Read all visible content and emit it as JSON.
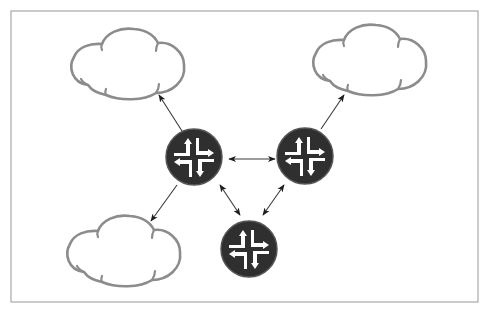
{
  "diagram": {
    "title": "",
    "colors": {
      "router_fill": "#2f2f2f",
      "router_glyph": "#ffffff",
      "cloud_stroke": "#8c8c8c",
      "link_stroke": "#3a3a3a",
      "frame_stroke": "#a8a8a8",
      "background": "#ffffff"
    },
    "nodes": [
      {
        "id": "cloud-top-left",
        "type": "cloud",
        "icon": "cloud-icon",
        "label": ""
      },
      {
        "id": "cloud-top-right",
        "type": "cloud",
        "icon": "cloud-icon",
        "label": ""
      },
      {
        "id": "cloud-bottom-left",
        "type": "cloud",
        "icon": "cloud-icon",
        "label": ""
      },
      {
        "id": "router-left",
        "type": "router",
        "icon": "router-icon",
        "label": ""
      },
      {
        "id": "router-right",
        "type": "router",
        "icon": "router-icon",
        "label": ""
      },
      {
        "id": "router-bottom",
        "type": "router",
        "icon": "router-icon",
        "label": ""
      }
    ],
    "edges": [
      {
        "from": "router-left",
        "to": "cloud-top-left",
        "direction": "forward"
      },
      {
        "from": "router-left",
        "to": "cloud-bottom-left",
        "direction": "forward"
      },
      {
        "from": "router-right",
        "to": "cloud-top-right",
        "direction": "forward"
      },
      {
        "from": "router-left",
        "to": "router-right",
        "direction": "both"
      },
      {
        "from": "router-left",
        "to": "router-bottom",
        "direction": "both"
      },
      {
        "from": "router-right",
        "to": "router-bottom",
        "direction": "both"
      }
    ]
  }
}
